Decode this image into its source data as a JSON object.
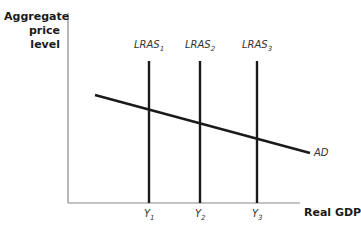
{
  "diagram": {
    "y_axis_label": "Aggregate price level",
    "x_axis_label": "Real GDP",
    "curves": [
      {
        "name": "LRAS",
        "sub": "1",
        "type": "vertical"
      },
      {
        "name": "LRAS",
        "sub": "2",
        "type": "vertical"
      },
      {
        "name": "LRAS",
        "sub": "3",
        "type": "vertical"
      },
      {
        "name": "AD",
        "type": "downward-sloping"
      }
    ],
    "x_ticks": [
      {
        "name": "Y",
        "sub": "1"
      },
      {
        "name": "Y",
        "sub": "2"
      },
      {
        "name": "Y",
        "sub": "3"
      }
    ],
    "colors": {
      "axis": "#8a8a8a",
      "curve": "#1a1a1a",
      "text": "#1a1a1a"
    }
  }
}
